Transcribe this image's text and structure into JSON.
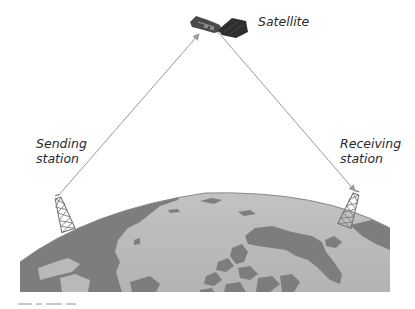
{
  "diagram": {
    "nodes": [
      {
        "id": "satellite",
        "label": "Satellite"
      },
      {
        "id": "sending",
        "label": "Sending\nstation"
      },
      {
        "id": "receiving",
        "label": "Receiving\nstation"
      }
    ],
    "edges": [
      {
        "from": "sending",
        "to": "satellite",
        "style": "arrow"
      },
      {
        "from": "satellite",
        "to": "receiving",
        "style": "arrow"
      }
    ],
    "background": "earth-globe-arc"
  },
  "labels": {
    "satellite": "Satellite",
    "sending": "Sending\nstation",
    "receiving": "Receiving\nstation"
  },
  "colors": {
    "ocean": "#b9b9b9",
    "land": "#7d7d7d",
    "signal_line": "#9a9a9a",
    "label_text": "#2a2a2a",
    "tower": "#6e6e6e",
    "satellite_panel": "#3a3a3a"
  }
}
